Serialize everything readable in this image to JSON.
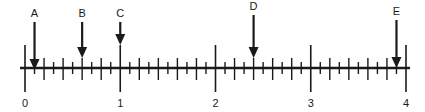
{
  "diagram": {
    "type": "number-line",
    "colors": {
      "ink": "#1a1a1a",
      "background": "#ffffff"
    },
    "axis": {
      "min": 0,
      "max": 4,
      "major_step": 1,
      "minor_step": 0.1,
      "major_labels": [
        "0",
        "1",
        "2",
        "3",
        "4"
      ]
    },
    "markers": [
      {
        "label": "A",
        "value": 0.1
      },
      {
        "label": "B",
        "value": 0.6
      },
      {
        "label": "C",
        "value": 1.0
      },
      {
        "label": "D",
        "value": 2.4
      },
      {
        "label": "E",
        "value": 3.9
      }
    ]
  }
}
